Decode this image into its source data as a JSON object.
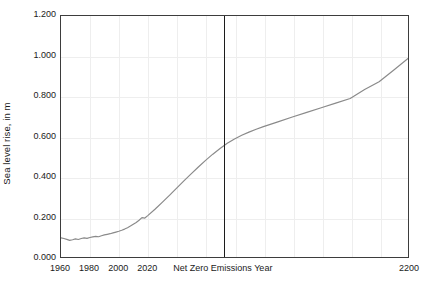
{
  "chart_data": {
    "type": "line",
    "title": "",
    "subtitle": "",
    "xlabel": "",
    "ylabel": "Sea level rise, in m",
    "xlim": [
      1960,
      2200
    ],
    "ylim": [
      0.0,
      1.2
    ],
    "grid": true,
    "legend": null,
    "x_ticks": [
      {
        "value": 1960,
        "label": "1960"
      },
      {
        "value": 1980,
        "label": "1980"
      },
      {
        "value": 2000,
        "label": "2000"
      },
      {
        "value": 2020,
        "label": "2020"
      },
      {
        "value": 2200,
        "label": "2200"
      }
    ],
    "y_ticks": [
      {
        "value": 0.0,
        "label": "0.000"
      },
      {
        "value": 0.2,
        "label": "0.200"
      },
      {
        "value": 0.4,
        "label": "0.400"
      },
      {
        "value": 0.6,
        "label": "0.600"
      },
      {
        "value": 0.8,
        "label": "0.800"
      },
      {
        "value": 1.0,
        "label": "1.000"
      },
      {
        "value": 1.2,
        "label": "1.200"
      }
    ],
    "gridlines_x": [
      1980,
      2000,
      2020,
      2040,
      2060,
      2080,
      2100,
      2120,
      2140,
      2160,
      2180
    ],
    "gridlines_y": [
      0.2,
      0.4,
      0.6,
      0.8,
      1.0
    ],
    "annotations": [
      {
        "name": "net-zero-emissions-year",
        "type": "vline",
        "x": 2072,
        "label": "Net Zero Emissions Year",
        "color": "#1c1c1c"
      }
    ],
    "series": [
      {
        "name": "Sea level rise",
        "color": "#8a8a8a",
        "x": [
          1960,
          1962,
          1964,
          1966,
          1968,
          1970,
          1972,
          1974,
          1976,
          1978,
          1980,
          1982,
          1984,
          1986,
          1988,
          1990,
          1992,
          1994,
          1996,
          1998,
          2000,
          2002,
          2004,
          2006,
          2008,
          2010,
          2012,
          2014,
          2016,
          2018,
          2020,
          2025,
          2030,
          2035,
          2040,
          2045,
          2050,
          2055,
          2060,
          2065,
          2070,
          2075,
          2080,
          2085,
          2090,
          2095,
          2100,
          2110,
          2120,
          2130,
          2140,
          2150,
          2160,
          2170,
          2180,
          2190,
          2200
        ],
        "y": [
          0.095,
          0.092,
          0.088,
          0.083,
          0.086,
          0.09,
          0.087,
          0.092,
          0.095,
          0.093,
          0.097,
          0.1,
          0.103,
          0.101,
          0.106,
          0.11,
          0.113,
          0.116,
          0.12,
          0.124,
          0.128,
          0.133,
          0.139,
          0.146,
          0.154,
          0.163,
          0.172,
          0.183,
          0.196,
          0.194,
          0.206,
          0.238,
          0.272,
          0.307,
          0.343,
          0.379,
          0.414,
          0.448,
          0.481,
          0.512,
          0.54,
          0.566,
          0.588,
          0.606,
          0.622,
          0.636,
          0.649,
          0.673,
          0.697,
          0.72,
          0.743,
          0.766,
          0.789,
          0.834,
          0.873,
          0.93,
          0.988
        ]
      }
    ]
  },
  "axes": {
    "y_title": "Sea level rise, in m",
    "x_center_label": "Net Zero Emissions Year"
  },
  "colors": {
    "series_line": "#8a8a8a",
    "vline": "#1c1c1c",
    "frame": "#3d3d3d",
    "grid": "#eeeeee",
    "background": "#ffffff",
    "text": "#1a1a1a"
  }
}
